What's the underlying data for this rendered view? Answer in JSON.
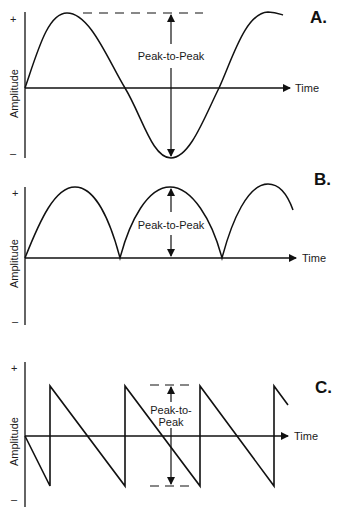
{
  "panels": [
    {
      "id": "A",
      "letter": "A.",
      "waveform": "sine",
      "y_label": "Amplitude",
      "x_label": "Time",
      "plus": "+",
      "minus": "–",
      "measure_label": "Peak-to-Peak"
    },
    {
      "id": "B",
      "letter": "B.",
      "waveform": "full-wave rectified sine",
      "y_label": "Amplitude",
      "x_label": "Time",
      "plus": "+",
      "minus": "–",
      "measure_label": "Peak-to-Peak"
    },
    {
      "id": "C",
      "letter": "C.",
      "waveform": "sawtooth",
      "y_label": "Amplitude",
      "x_label": "Time",
      "plus": "+",
      "minus": "–",
      "measure_label_line1": "Peak-to-",
      "measure_label_line2": "Peak"
    }
  ],
  "colors": {
    "ink": "#111111",
    "background": "#ffffff"
  }
}
